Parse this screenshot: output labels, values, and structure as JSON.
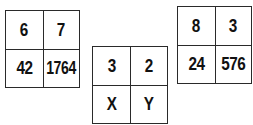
{
  "puzzle": {
    "grids": [
      {
        "cells": [
          "6",
          "7",
          "42",
          "1764"
        ]
      },
      {
        "cells": [
          "3",
          "2",
          "X",
          "Y"
        ]
      },
      {
        "cells": [
          "8",
          "3",
          "24",
          "576"
        ]
      }
    ]
  }
}
